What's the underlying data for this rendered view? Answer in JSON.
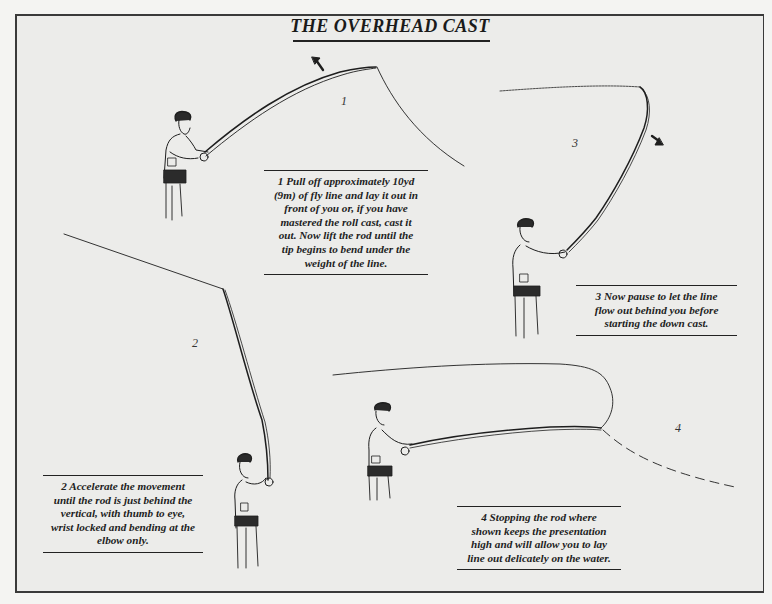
{
  "title": "THE OVERHEAD CAST",
  "colors": {
    "background": "#ececea",
    "ink": "#1e1e1e",
    "frame": "#3a3a3a"
  },
  "steps": [
    {
      "number": "1",
      "caption": "1 Pull off approximately 10yd (9m) of fly line and lay it out in front of you or, if you have mastered the roll cast, cast it out. Now lift the rod until the tip begins to bend under the weight of the line.",
      "caption_lines": [
        "1 Pull off approximately 10yd",
        "(9m) of fly line and lay it out in",
        "front of you or, if you have",
        "mastered the roll cast, cast it",
        "out. Now lift the rod until the",
        "tip begins to bend under the",
        "weight of the line."
      ],
      "arrow": "up-left-arrow"
    },
    {
      "number": "2",
      "caption": "2 Accelerate the movement until the rod is just behind the vertical, with thumb to eye, wrist locked and bending at the elbow only.",
      "caption_lines": [
        "2 Accelerate the movement",
        "until the rod is just behind the",
        "vertical, with thumb to eye,",
        "wrist locked and bending at the",
        "elbow only."
      ]
    },
    {
      "number": "3",
      "caption": "3 Now pause to let the line flow out behind you before starting the down cast.",
      "caption_lines": [
        "3 Now pause  to let the line",
        "flow out behind you before",
        "starting the down cast."
      ],
      "arrow": "down-right-arrow"
    },
    {
      "number": "4",
      "caption": "4 Stopping the rod where shown keeps the presentation high and will allow you to lay line out delicately on the water.",
      "caption_lines": [
        "4 Stopping the rod where",
        "shown keeps the presentation",
        "high and will allow you to lay",
        "line out delicately on the water."
      ]
    }
  ]
}
